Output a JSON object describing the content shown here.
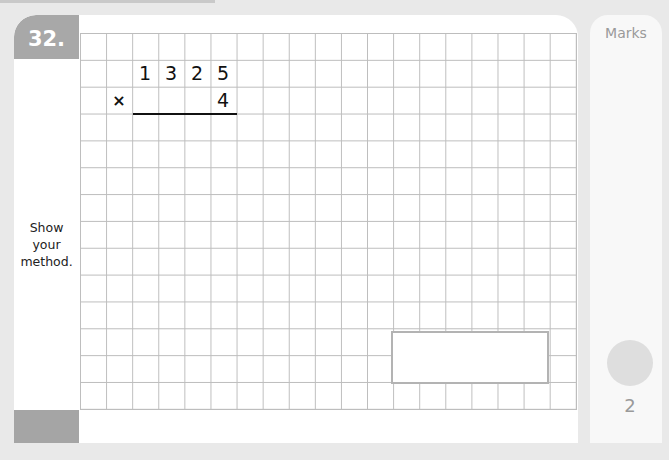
{
  "question": {
    "number": "32.",
    "prompt_lines": [
      "Show",
      "your",
      "method."
    ],
    "multiplication": {
      "top_digits": [
        "1",
        "3",
        "2",
        "5"
      ],
      "operator": "×",
      "bottom_digits": [
        "",
        "",
        "",
        "4"
      ]
    },
    "answer_box": {
      "value": ""
    }
  },
  "marks": {
    "label": "Marks",
    "value": "2"
  },
  "colors": {
    "background": "#e9e9e9",
    "question_tab": "#a8a8a8",
    "grid_line": "#bdbdbd",
    "answer_border": "#b3b3b3"
  }
}
